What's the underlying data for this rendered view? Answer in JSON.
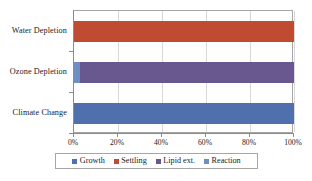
{
  "chart_data": {
    "type": "bar",
    "orientation": "horizontal",
    "stacked": "100%",
    "title": "",
    "xlabel": "",
    "ylabel": "",
    "categories": [
      "Climate Change",
      "Ozone Depletion",
      "Water Depletion"
    ],
    "xticks": [
      "0%",
      "20%",
      "40%",
      "60%",
      "80%",
      "100%"
    ],
    "xtick_values": [
      0,
      20,
      40,
      60,
      80,
      100
    ],
    "xlim": [
      0,
      100
    ],
    "grid": true,
    "legend_position": "bottom",
    "series": [
      {
        "name": "Growth",
        "color": "#4f6fad",
        "values": [
          100.0,
          0.0,
          0.0
        ]
      },
      {
        "name": "Settling",
        "color": "#bf4b32",
        "values": [
          0.0,
          0.0,
          100.0
        ]
      },
      {
        "name": "Lipid ext.",
        "color": "#69578f",
        "values": [
          0.0,
          97.5,
          0.0
        ]
      },
      {
        "name": "Reaction",
        "color": "#6f8fc4",
        "values": [
          0.0,
          2.5,
          0.0
        ]
      }
    ],
    "bars": [
      {
        "category": "Water Depletion",
        "segments": [
          {
            "series": "Settling",
            "color": "#bf4b32",
            "start": 0.0,
            "value": 100.0
          }
        ]
      },
      {
        "category": "Ozone Depletion",
        "segments": [
          {
            "series": "Reaction",
            "color": "#6f8fc4",
            "start": 0.0,
            "value": 2.5
          },
          {
            "series": "Lipid ext.",
            "color": "#69578f",
            "start": 2.5,
            "value": 97.5
          }
        ]
      },
      {
        "category": "Climate Change",
        "segments": [
          {
            "series": "Growth",
            "color": "#4f6fad",
            "start": 0.0,
            "value": 100.0
          }
        ]
      }
    ]
  },
  "legend": {
    "items": [
      {
        "label": "Growth",
        "color": "#4f6fad"
      },
      {
        "label": "Settling",
        "color": "#bf4b32"
      },
      {
        "label": "Lipid ext.",
        "color": "#69578f"
      },
      {
        "label": "Reaction",
        "color": "#6f8fc4"
      }
    ]
  },
  "axis": {
    "x_labels": [
      "0%",
      "20%",
      "40%",
      "60%",
      "80%",
      "100%"
    ],
    "y_labels": [
      "Water Depletion",
      "Ozone Depletion",
      "Climate Change"
    ]
  },
  "style": {
    "plot_border": "#a6a6a6",
    "gridline": "#d9d9d9",
    "axis_line": "#8c8c8c",
    "background": "#ffffff",
    "text": "#1a1a1a"
  }
}
